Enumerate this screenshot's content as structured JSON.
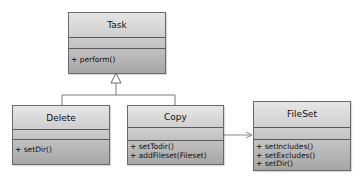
{
  "diagram": {
    "type": "uml-class-diagram",
    "classes": [
      {
        "id": "task",
        "name": "Task",
        "attributes": [],
        "operations": [
          "+ perform()"
        ]
      },
      {
        "id": "delete",
        "name": "Delete",
        "attributes": [],
        "operations": [
          "+ setDir()"
        ]
      },
      {
        "id": "copy",
        "name": "Copy",
        "attributes": [],
        "operations": [
          "+ setTodir()",
          "+ addFileset(Fileset)"
        ]
      },
      {
        "id": "fileset",
        "name": "FileSet",
        "attributes": [],
        "operations": [
          "+ setIncludes()",
          "+ setExcludes()",
          "+ setDir()"
        ]
      }
    ],
    "relationships": [
      {
        "type": "generalization",
        "from": "Delete",
        "to": "Task"
      },
      {
        "type": "generalization",
        "from": "Copy",
        "to": "Task"
      },
      {
        "type": "association",
        "from": "Copy",
        "to": "FileSet",
        "navigable": true
      }
    ],
    "colors": {
      "border": "#6a6a6a",
      "fill_top": "#e6e6e6",
      "fill_bottom": "#a6a6a6",
      "line": "#7a7a7a"
    }
  }
}
